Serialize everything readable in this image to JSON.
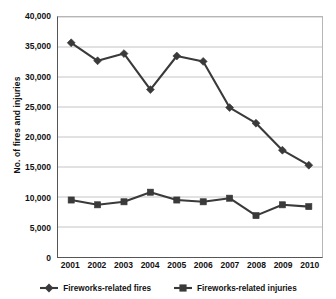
{
  "chart_data": {
    "type": "line",
    "title": "",
    "xlabel": "",
    "ylabel": "No. of fires and injuries",
    "categories": [
      "2001",
      "2002",
      "2003",
      "2004",
      "2005",
      "2006",
      "2007",
      "2008",
      "2009",
      "2010"
    ],
    "ylim": [
      0,
      40000
    ],
    "ytick_labels": [
      "40,000",
      "35,000",
      "30,000",
      "25,000",
      "20,000",
      "15,000",
      "10,000",
      "5,000",
      "0"
    ],
    "ytick_values": [
      40000,
      35000,
      30000,
      25000,
      20000,
      15000,
      10000,
      5000,
      0
    ],
    "grid": "horizontal",
    "legend_position": "bottom",
    "series": [
      {
        "name": "Fireworks-related fires",
        "marker": "diamond",
        "color": "#3a3a3a",
        "values": [
          35700,
          32700,
          33900,
          27900,
          33500,
          32600,
          24900,
          22300,
          17800,
          15300
        ]
      },
      {
        "name": "Fireworks-related injuries",
        "marker": "square",
        "color": "#3a3a3a",
        "values": [
          9500,
          8700,
          9200,
          10800,
          9500,
          9200,
          9800,
          6900,
          8700,
          8400
        ]
      }
    ]
  }
}
